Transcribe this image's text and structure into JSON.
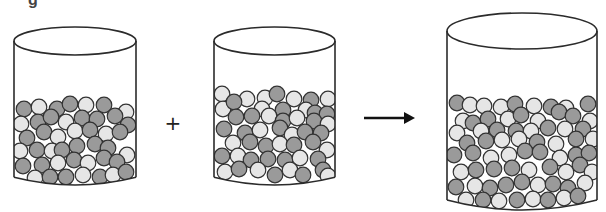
{
  "figure": {
    "caption_fragment": "g",
    "operator_plus": "+",
    "colors": {
      "outline": "#2b2b2b",
      "ball_dark": "#9a9a9a",
      "ball_light": "#e6e6e6",
      "ball_stroke": "#333333",
      "background": "#ffffff"
    },
    "containers": [
      {
        "id": "left-beaker",
        "x": 14,
        "width": 122,
        "rim_cy": 41,
        "rim_ry": 14,
        "bottom_y": 185,
        "balls": [
          [
            24,
            109,
            "d"
          ],
          [
            39,
            107,
            "l"
          ],
          [
            57,
            109,
            "d"
          ],
          [
            70,
            104,
            "d"
          ],
          [
            86,
            105,
            "l"
          ],
          [
            104,
            105,
            "d"
          ],
          [
            126,
            112,
            "l"
          ],
          [
            21,
            124,
            "l"
          ],
          [
            38,
            122,
            "d"
          ],
          [
            51,
            117,
            "d"
          ],
          [
            66,
            122,
            "l"
          ],
          [
            82,
            118,
            "d"
          ],
          [
            97,
            119,
            "d"
          ],
          [
            115,
            116,
            "d"
          ],
          [
            128,
            125,
            "d"
          ],
          [
            27,
            138,
            "d"
          ],
          [
            44,
            132,
            "d"
          ],
          [
            58,
            137,
            "l"
          ],
          [
            75,
            131,
            "l"
          ],
          [
            90,
            130,
            "d"
          ],
          [
            106,
            134,
            "l"
          ],
          [
            120,
            132,
            "d"
          ],
          [
            20,
            151,
            "l"
          ],
          [
            37,
            150,
            "d"
          ],
          [
            52,
            151,
            "l"
          ],
          [
            62,
            150,
            "d"
          ],
          [
            77,
            146,
            "d"
          ],
          [
            95,
            144,
            "d"
          ],
          [
            108,
            148,
            "d"
          ],
          [
            127,
            155,
            "l"
          ],
          [
            23,
            166,
            "d"
          ],
          [
            42,
            165,
            "d"
          ],
          [
            58,
            163,
            "l"
          ],
          [
            74,
            160,
            "d"
          ],
          [
            88,
            163,
            "l"
          ],
          [
            104,
            158,
            "d"
          ],
          [
            117,
            162,
            "d"
          ],
          [
            35,
            178,
            "l"
          ],
          [
            50,
            177,
            "d"
          ],
          [
            66,
            177,
            "d"
          ],
          [
            83,
            175,
            "l"
          ],
          [
            100,
            177,
            "d"
          ],
          [
            113,
            175,
            "l"
          ],
          [
            126,
            172,
            "d"
          ]
        ]
      },
      {
        "id": "middle-beaker",
        "x": 214,
        "width": 121,
        "rim_cy": 41,
        "rim_ry": 14,
        "bottom_y": 185,
        "balls": [
          [
            222,
            94,
            "l"
          ],
          [
            247,
            99,
            "l"
          ],
          [
            265,
            98,
            "l"
          ],
          [
            277,
            94,
            "d"
          ],
          [
            294,
            99,
            "l"
          ],
          [
            311,
            100,
            "d"
          ],
          [
            328,
            99,
            "l"
          ],
          [
            223,
            109,
            "l"
          ],
          [
            234,
            102,
            "d"
          ],
          [
            262,
            109,
            "l"
          ],
          [
            283,
            110,
            "d"
          ],
          [
            306,
            110,
            "l"
          ],
          [
            315,
            113,
            "d"
          ],
          [
            327,
            114,
            "d"
          ],
          [
            236,
            117,
            "d"
          ],
          [
            252,
            116,
            "d"
          ],
          [
            269,
            116,
            "l"
          ],
          [
            283,
            121,
            "d"
          ],
          [
            297,
            118,
            "l"
          ],
          [
            314,
            121,
            "d"
          ],
          [
            328,
            124,
            "l"
          ],
          [
            224,
            129,
            "d"
          ],
          [
            245,
            133,
            "d"
          ],
          [
            260,
            130,
            "l"
          ],
          [
            280,
            128,
            "d"
          ],
          [
            292,
            135,
            "l"
          ],
          [
            305,
            132,
            "d"
          ],
          [
            321,
            133,
            "d"
          ],
          [
            233,
            143,
            "l"
          ],
          [
            250,
            142,
            "d"
          ],
          [
            266,
            146,
            "d"
          ],
          [
            280,
            144,
            "l"
          ],
          [
            294,
            145,
            "d"
          ],
          [
            313,
            142,
            "d"
          ],
          [
            327,
            150,
            "l"
          ],
          [
            222,
            156,
            "d"
          ],
          [
            238,
            156,
            "l"
          ],
          [
            251,
            160,
            "d"
          ],
          [
            268,
            159,
            "d"
          ],
          [
            285,
            160,
            "d"
          ],
          [
            300,
            158,
            "l"
          ],
          [
            318,
            159,
            "d"
          ],
          [
            225,
            172,
            "l"
          ],
          [
            239,
            169,
            "d"
          ],
          [
            258,
            170,
            "l"
          ],
          [
            275,
            175,
            "d"
          ],
          [
            290,
            170,
            "l"
          ],
          [
            303,
            175,
            "d"
          ],
          [
            323,
            170,
            "d"
          ],
          [
            328,
            176,
            "l"
          ]
        ]
      },
      {
        "id": "right-beaker",
        "x": 447,
        "width": 150,
        "rim_cy": 31,
        "rim_ry": 18,
        "bottom_y": 210,
        "balls": [
          [
            457,
            103,
            "d"
          ],
          [
            470,
            105,
            "l"
          ],
          [
            484,
            106,
            "l"
          ],
          [
            501,
            107,
            "l"
          ],
          [
            515,
            104,
            "d"
          ],
          [
            534,
            106,
            "l"
          ],
          [
            551,
            107,
            "d"
          ],
          [
            566,
            108,
            "l"
          ],
          [
            588,
            104,
            "d"
          ],
          [
            463,
            121,
            "l"
          ],
          [
            473,
            123,
            "d"
          ],
          [
            488,
            119,
            "d"
          ],
          [
            508,
            119,
            "l"
          ],
          [
            521,
            115,
            "d"
          ],
          [
            538,
            121,
            "l"
          ],
          [
            559,
            112,
            "d"
          ],
          [
            573,
            116,
            "d"
          ],
          [
            590,
            121,
            "l"
          ],
          [
            457,
            133,
            "l"
          ],
          [
            481,
            131,
            "l"
          ],
          [
            497,
            130,
            "d"
          ],
          [
            516,
            131,
            "d"
          ],
          [
            531,
            131,
            "l"
          ],
          [
            548,
            128,
            "d"
          ],
          [
            565,
            129,
            "l"
          ],
          [
            583,
            129,
            "d"
          ],
          [
            467,
            143,
            "d"
          ],
          [
            486,
            141,
            "d"
          ],
          [
            502,
            140,
            "l"
          ],
          [
            519,
            139,
            "l"
          ],
          [
            537,
            142,
            "d"
          ],
          [
            556,
            144,
            "l"
          ],
          [
            576,
            139,
            "d"
          ],
          [
            593,
            139,
            "l"
          ],
          [
            454,
            155,
            "d"
          ],
          [
            473,
            153,
            "d"
          ],
          [
            491,
            158,
            "l"
          ],
          [
            509,
            155,
            "l"
          ],
          [
            525,
            151,
            "d"
          ],
          [
            540,
            152,
            "d"
          ],
          [
            560,
            158,
            "l"
          ],
          [
            576,
            155,
            "d"
          ],
          [
            589,
            153,
            "d"
          ],
          [
            461,
            172,
            "l"
          ],
          [
            476,
            170,
            "d"
          ],
          [
            494,
            169,
            "d"
          ],
          [
            512,
            168,
            "d"
          ],
          [
            529,
            170,
            "l"
          ],
          [
            550,
            167,
            "d"
          ],
          [
            566,
            172,
            "l"
          ],
          [
            580,
            165,
            "d"
          ],
          [
            592,
            172,
            "l"
          ],
          [
            456,
            187,
            "d"
          ],
          [
            475,
            186,
            "l"
          ],
          [
            490,
            188,
            "d"
          ],
          [
            506,
            185,
            "d"
          ],
          [
            522,
            182,
            "d"
          ],
          [
            538,
            185,
            "l"
          ],
          [
            553,
            184,
            "d"
          ],
          [
            568,
            188,
            "d"
          ],
          [
            585,
            183,
            "l"
          ],
          [
            466,
            200,
            "l"
          ],
          [
            483,
            200,
            "d"
          ],
          [
            499,
            201,
            "l"
          ],
          [
            517,
            200,
            "d"
          ],
          [
            533,
            199,
            "l"
          ],
          [
            548,
            200,
            "d"
          ],
          [
            564,
            198,
            "l"
          ],
          [
            578,
            196,
            "d"
          ]
        ]
      }
    ],
    "plus": {
      "x": 173,
      "y": 123
    },
    "arrow": {
      "x1": 364,
      "x2": 415,
      "y": 118
    }
  }
}
